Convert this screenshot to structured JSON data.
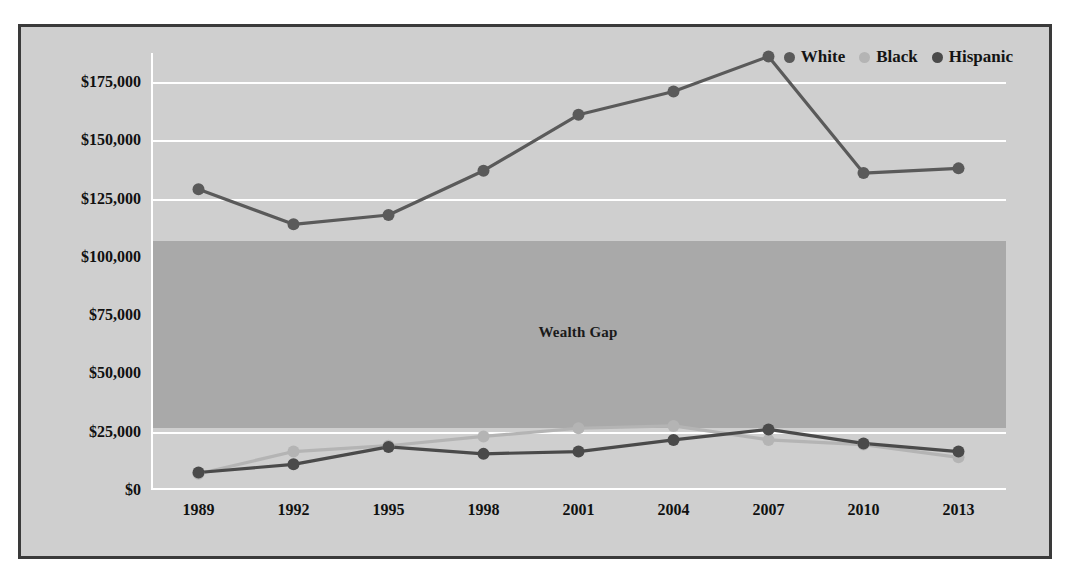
{
  "chart_data": {
    "type": "line",
    "title": "",
    "xlabel": "",
    "ylabel": "",
    "categories": [
      "1989",
      "1992",
      "1995",
      "1998",
      "2001",
      "2004",
      "2007",
      "2010",
      "2013"
    ],
    "ylim": [
      0,
      187500
    ],
    "ytick_labels": [
      "$0",
      "$25,000",
      "$50,000",
      "$75,000",
      "$100,000",
      "$125,000",
      "$150,000",
      "$175,000"
    ],
    "ytick_values": [
      0,
      25000,
      50000,
      75000,
      100000,
      125000,
      150000,
      175000
    ],
    "grid": "horizontal",
    "legend_position": "top-right",
    "series": [
      {
        "name": "White",
        "color": "#5a5a5a",
        "values": [
          129000,
          114000,
          118000,
          137000,
          161000,
          171000,
          186000,
          136000,
          138000
        ]
      },
      {
        "name": "Black",
        "color": "#b4b4b4",
        "values": [
          7000,
          16500,
          19000,
          23000,
          26500,
          27500,
          21500,
          19500,
          14000
        ]
      },
      {
        "name": "Hispanic",
        "color": "#4a4a4a",
        "values": [
          7500,
          11000,
          18500,
          15500,
          16500,
          21500,
          26000,
          20000,
          16500
        ]
      }
    ],
    "annotations": [
      {
        "text": "Wealth Gap",
        "type": "band-label",
        "band_from": 26500,
        "band_to": 107000
      }
    ]
  },
  "legend": {
    "items": [
      {
        "label": "White",
        "color": "#5a5a5a"
      },
      {
        "label": "Black",
        "color": "#b4b4b4"
      },
      {
        "label": "Hispanic",
        "color": "#4a4a4a"
      }
    ]
  },
  "colors": {
    "figure_background": "#cfcfcf",
    "plot_background": "#d4d4d4",
    "band_fill": "#a9a9a9",
    "gridline": "#ffffff",
    "frame": "#3a3a3a",
    "text": "#111111"
  }
}
